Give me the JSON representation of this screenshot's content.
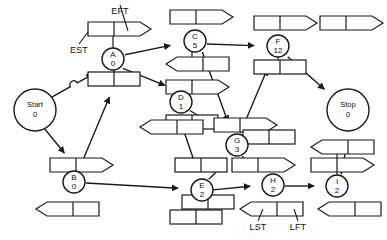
{
  "diagram": {
    "stroke_color": "#1a1a1a",
    "fill_color": "#ffffff",
    "canvas": {
      "width": 387,
      "height": 240
    },
    "annotations": [
      {
        "name": "est-label",
        "text": "EST",
        "x": 79,
        "y": 51,
        "leader_to_x": 88,
        "leader_to_y": 32
      },
      {
        "name": "eft-label",
        "text": "EFT",
        "x": 120,
        "y": 12,
        "leader_to_x": 128,
        "leader_to_y": 31
      },
      {
        "name": "lst-label",
        "text": "LST",
        "x": 258,
        "y": 228,
        "leader_to_x": 263,
        "leader_to_y": 209
      },
      {
        "name": "lft-label",
        "text": "LFT",
        "x": 298,
        "y": 228,
        "leader_to_x": 294,
        "leader_to_y": 209
      }
    ],
    "nodes": [
      {
        "id": "start",
        "label": "Start",
        "value": "0",
        "cx": 35,
        "cy": 110,
        "r": 21,
        "big": true
      },
      {
        "id": "stop",
        "label": "Stop",
        "value": "0",
        "cx": 348,
        "cy": 110,
        "r": 21,
        "big": true
      },
      {
        "id": "A",
        "label": "A",
        "value": "0",
        "cx": 113,
        "cy": 59,
        "r": 11,
        "big": false
      },
      {
        "id": "B",
        "label": "B",
        "value": "0",
        "cx": 74,
        "cy": 182,
        "r": 11,
        "big": false
      },
      {
        "id": "C",
        "label": "C",
        "value": "5",
        "cx": 195,
        "cy": 41,
        "r": 11,
        "big": false
      },
      {
        "id": "D",
        "label": "D",
        "value": "1",
        "cx": 181,
        "cy": 102,
        "r": 11,
        "big": false
      },
      {
        "id": "E",
        "label": "E",
        "value": "2",
        "cx": 202,
        "cy": 190,
        "r": 11,
        "big": false
      },
      {
        "id": "F",
        "label": "F",
        "value": "12",
        "cx": 278,
        "cy": 46,
        "r": 11,
        "big": false
      },
      {
        "id": "G",
        "label": "G",
        "value": "3",
        "cx": 237,
        "cy": 145,
        "r": 11,
        "big": false
      },
      {
        "id": "H",
        "label": "H",
        "value": "2",
        "cx": 273,
        "cy": 185,
        "r": 11,
        "big": false
      },
      {
        "id": "I",
        "label": "I",
        "value": "2",
        "cx": 337,
        "cy": 186,
        "r": 11,
        "big": false
      }
    ],
    "early_boxes": [
      {
        "name": "est-eft-box-legend",
        "x": 88,
        "y": 22,
        "w": 52,
        "h": 14
      },
      {
        "name": "est-eft-box-A",
        "x": 88,
        "y": 72,
        "w": 52,
        "h": 14,
        "plain": true
      },
      {
        "name": "est-eft-box-C",
        "x": 170,
        "y": 10,
        "w": 52,
        "h": 14
      },
      {
        "name": "est-eft-box-D",
        "x": 166,
        "y": 80,
        "w": 52,
        "h": 14
      },
      {
        "name": "est-eft-box-D-out",
        "x": 166,
        "y": 115,
        "w": 52,
        "h": 14,
        "plain": true
      },
      {
        "name": "est-eft-box-F",
        "x": 254,
        "y": 16,
        "w": 52,
        "h": 14
      },
      {
        "name": "est-eft-box-F-in",
        "x": 254,
        "y": 60,
        "w": 52,
        "h": 14,
        "plain": true
      },
      {
        "name": "est-eft-box-B",
        "x": 50,
        "y": 158,
        "w": 52,
        "h": 14
      },
      {
        "name": "est-eft-box-G",
        "x": 214,
        "y": 118,
        "w": 52,
        "h": 14
      },
      {
        "name": "est-eft-box-G-in",
        "x": 175,
        "y": 158,
        "w": 52,
        "h": 14,
        "plain": true
      },
      {
        "name": "est-eft-box-H",
        "x": 232,
        "y": 158,
        "w": 52,
        "h": 14
      },
      {
        "name": "est-eft-box-stop",
        "x": 320,
        "y": 16,
        "w": 52,
        "h": 14
      },
      {
        "name": "est-eft-box-I",
        "x": 311,
        "y": 158,
        "w": 52,
        "h": 14
      }
    ],
    "late_boxes": [
      {
        "name": "lst-lft-box-C",
        "x": 166,
        "y": 57,
        "w": 52,
        "h": 14
      },
      {
        "name": "lst-lft-box-D",
        "x": 140,
        "y": 120,
        "w": 52,
        "h": 14
      },
      {
        "name": "lst-lft-box-B",
        "x": 36,
        "y": 202,
        "w": 52,
        "h": 14
      },
      {
        "name": "lst-lft-box-E",
        "x": 170,
        "y": 210,
        "w": 52,
        "h": 14,
        "plain": true
      },
      {
        "name": "lst-lft-box-G",
        "x": 243,
        "y": 130,
        "w": 52,
        "h": 14,
        "plain": true
      },
      {
        "name": "lst-lft-box-I-u",
        "x": 311,
        "y": 140,
        "w": 52,
        "h": 14
      },
      {
        "name": "lst-lft-box-legend",
        "x": 240,
        "y": 202,
        "w": 52,
        "h": 14
      },
      {
        "name": "lst-lft-box-I",
        "x": 318,
        "y": 202,
        "w": 52,
        "h": 14
      },
      {
        "name": "lst-lft-box-E2",
        "x": 182,
        "y": 195,
        "w": 52,
        "h": 14,
        "plain": true
      }
    ],
    "edges": [
      {
        "name": "edge-start-A",
        "from": "Start",
        "to": "A"
      },
      {
        "name": "edge-start-B",
        "from": "Start",
        "to": "B"
      },
      {
        "name": "edge-A-C",
        "from": "A",
        "to": "C"
      },
      {
        "name": "edge-A-D",
        "from": "A",
        "to": "D"
      },
      {
        "name": "edge-B-A",
        "from": "B",
        "to": "A"
      },
      {
        "name": "edge-B-E",
        "from": "B",
        "to": "E"
      },
      {
        "name": "edge-C-F",
        "from": "C",
        "to": "F"
      },
      {
        "name": "edge-C-G",
        "from": "C",
        "to": "G"
      },
      {
        "name": "edge-D-G",
        "from": "D",
        "to": "G"
      },
      {
        "name": "edge-D-E",
        "from": "D",
        "to": "E"
      },
      {
        "name": "edge-E-G",
        "from": "E",
        "to": "G"
      },
      {
        "name": "edge-E-H",
        "from": "E",
        "to": "H"
      },
      {
        "name": "edge-G-H",
        "from": "G",
        "to": "H"
      },
      {
        "name": "edge-G-F",
        "from": "G",
        "to": "F"
      },
      {
        "name": "edge-F-stop",
        "from": "F",
        "to": "Stop"
      },
      {
        "name": "edge-H-I",
        "from": "H",
        "to": "I"
      },
      {
        "name": "edge-I-stop",
        "from": "I",
        "to": "Stop"
      }
    ]
  }
}
